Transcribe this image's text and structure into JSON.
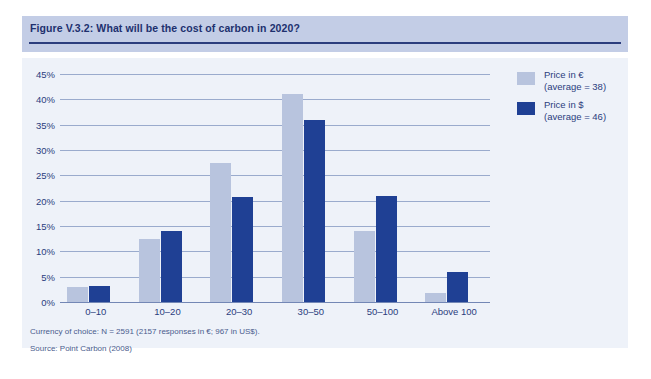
{
  "figure": {
    "title": "Figure V.3.2: What will be the cost of carbon in 2020?"
  },
  "legend": {
    "position": "top-right",
    "items": [
      {
        "label_line1": "Price in €",
        "label_line2": "(average = 38)",
        "color": "#b8c4de"
      },
      {
        "label_line1": "Price in $",
        "label_line2": "(average = 46)",
        "color": "#1f4094"
      }
    ]
  },
  "footnotes": {
    "currency": "Currency of choice: N = 2591 (2157 responses in €; 967 in US$).",
    "source": "Source: Point Carbon (2008)"
  },
  "colors": {
    "header_band": "#c3cde6",
    "header_rule": "#2b3d7d",
    "panel_bg": "#eef2f9",
    "gridline": "#9aabcd",
    "text": "#2b3d7d",
    "series_eur": "#b8c4de",
    "series_usd": "#1f4094"
  },
  "chart_data": {
    "type": "bar",
    "title": "Figure V.3.2: What will be the cost of carbon in 2020?",
    "xlabel": "",
    "ylabel": "",
    "categories": [
      "0–10",
      "10–20",
      "20–30",
      "30–50",
      "50–100",
      "Above 100"
    ],
    "series": [
      {
        "name": "Price in € (average = 38)",
        "color": "#b8c4de",
        "values": [
          3.0,
          12.5,
          27.5,
          41.0,
          14.0,
          1.8
        ]
      },
      {
        "name": "Price in $ (average = 46)",
        "color": "#1f4094",
        "values": [
          3.2,
          14.0,
          20.7,
          36.0,
          21.0,
          6.0
        ]
      }
    ],
    "ylim": [
      0,
      45
    ],
    "ytick_values": [
      0,
      5,
      10,
      15,
      20,
      25,
      30,
      35,
      40,
      45
    ],
    "ytick_labels": [
      "0%",
      "5%",
      "10%",
      "15%",
      "20%",
      "25%",
      "30%",
      "35%",
      "40%",
      "45%"
    ],
    "grid": true,
    "legend_position": "top-right",
    "value_unit": "%"
  }
}
